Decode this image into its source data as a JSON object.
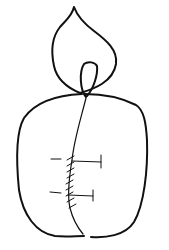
{
  "drawing": {
    "subject": "line sketch of a candle-like object with flame and stitched seam",
    "stroke_color": "#111111",
    "background_color": "#ffffff",
    "parts": [
      {
        "name": "flame",
        "description": "teardrop flame outline"
      },
      {
        "name": "wick",
        "description": "narrow loop inside flame base"
      },
      {
        "name": "body",
        "description": "rounded body outline"
      },
      {
        "name": "seam",
        "description": "vertical seam line with hatched stitches"
      },
      {
        "name": "markers",
        "description": "two horizontal T-shaped markers beside the seam"
      }
    ]
  }
}
